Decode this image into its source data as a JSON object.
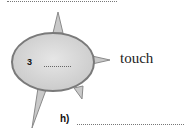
{
  "worksheet": {
    "bubble": {
      "number": "3",
      "fill_color": "#d7d7d7",
      "border_color": "#7a7a7a"
    },
    "word": "touch",
    "answer_label": "h)"
  }
}
